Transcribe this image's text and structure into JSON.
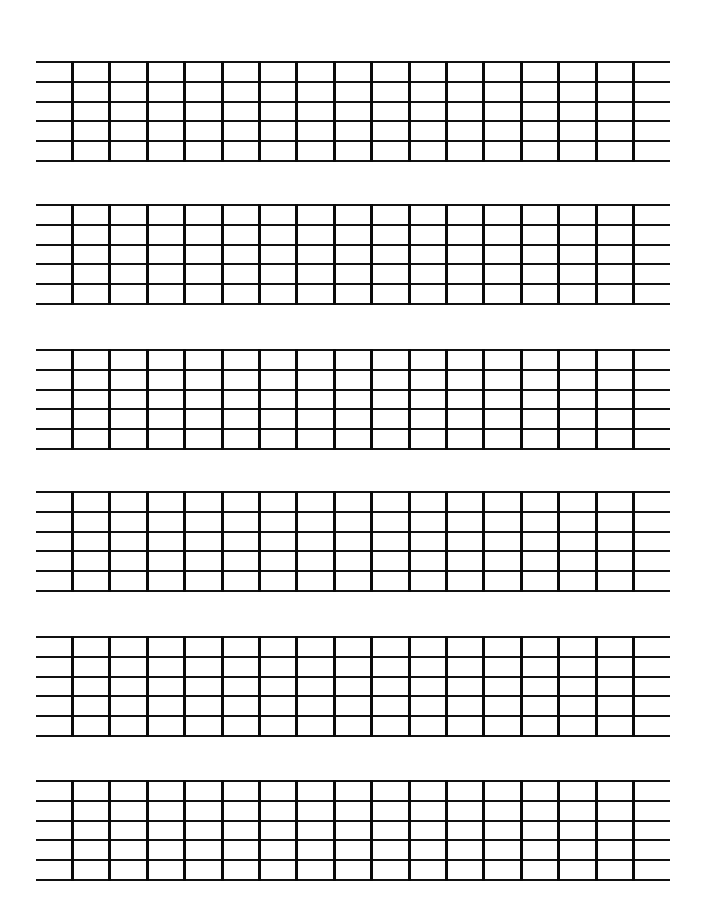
{
  "page": {
    "type": "blank guitar fretboard chart sheet",
    "background": "#ffffff",
    "line_color": "#111111"
  },
  "layout": {
    "block_count": 6,
    "strings_per_block": 6,
    "frets_per_block": 16,
    "block_tops": [
      61,
      204,
      349,
      491,
      636,
      780
    ],
    "string_spacing": 19.8,
    "line_left": 36,
    "line_right": 670,
    "first_fret_x": 72,
    "fret_spacing": 37.4
  }
}
